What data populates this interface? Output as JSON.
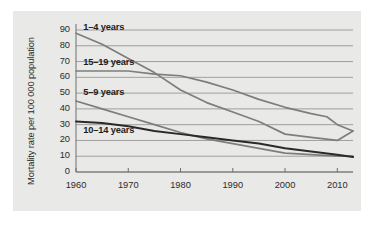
{
  "figure": {
    "background_color": "#e9e9e7",
    "page_color": "#ffffff",
    "axis_color": "#6e6e6e",
    "grid_color": "#8c8c8c"
  },
  "axes": {
    "y_label": "Mortality rate per 100 000 population",
    "y_ticks": [
      "0",
      "10",
      "20",
      "30",
      "40",
      "50",
      "60",
      "70",
      "80",
      "90"
    ],
    "x_ticks": [
      "1960",
      "1970",
      "1980",
      "1990",
      "2000",
      "2010"
    ]
  },
  "series_labels": {
    "s1": "1–4 years",
    "s2": "15–19 years",
    "s3": "5–9 years",
    "s4": "10–14 years"
  },
  "chart_data": {
    "type": "line",
    "title": "",
    "xlabel": "",
    "ylabel": "Mortality rate per 100 000 population",
    "xlim": [
      1960,
      2013
    ],
    "ylim": [
      0,
      90
    ],
    "xticks": [
      1960,
      1970,
      1980,
      1990,
      2000,
      2010
    ],
    "yticks": [
      0,
      10,
      20,
      30,
      40,
      50,
      60,
      70,
      80,
      90
    ],
    "grid": "horizontal",
    "legend": "inline-labels",
    "series": [
      {
        "name": "1–4 years",
        "color": "#7d7d7d",
        "label_position": {
          "x": 1961,
          "y": 91
        },
        "x": [
          1960,
          1965,
          1970,
          1975,
          1980,
          1985,
          1990,
          1995,
          2000,
          2005,
          2010,
          2013
        ],
        "values": [
          88,
          81,
          72,
          63,
          52,
          44,
          38,
          32,
          24,
          22,
          20,
          26
        ]
      },
      {
        "name": "15–19 years",
        "color": "#7d7d7d",
        "label_position": {
          "x": 1961,
          "y": 69
        },
        "x": [
          1960,
          1965,
          1970,
          1975,
          1980,
          1985,
          1990,
          1995,
          2000,
          2005,
          2008,
          2010,
          2013
        ],
        "values": [
          64,
          64,
          64,
          62,
          61,
          57,
          52,
          46,
          41,
          37,
          35,
          30,
          26
        ]
      },
      {
        "name": "5–9 years",
        "color": "#7d7d7d",
        "label_position": {
          "x": 1961,
          "y": 50
        },
        "x": [
          1960,
          1965,
          1970,
          1975,
          1980,
          1985,
          1990,
          1995,
          2000,
          2005,
          2010,
          2013
        ],
        "values": [
          45,
          40,
          35,
          30,
          25,
          21,
          18,
          15,
          12,
          11,
          10,
          10
        ]
      },
      {
        "name": "10–14 years",
        "color": "#2a2a2a",
        "label_position": {
          "x": 1961,
          "y": 26
        },
        "x": [
          1960,
          1965,
          1970,
          1975,
          1980,
          1985,
          1990,
          1995,
          2000,
          2005,
          2010,
          2013
        ],
        "values": [
          32,
          31,
          29,
          26,
          24,
          22,
          20,
          18,
          15,
          13,
          11,
          9.5
        ]
      }
    ]
  }
}
